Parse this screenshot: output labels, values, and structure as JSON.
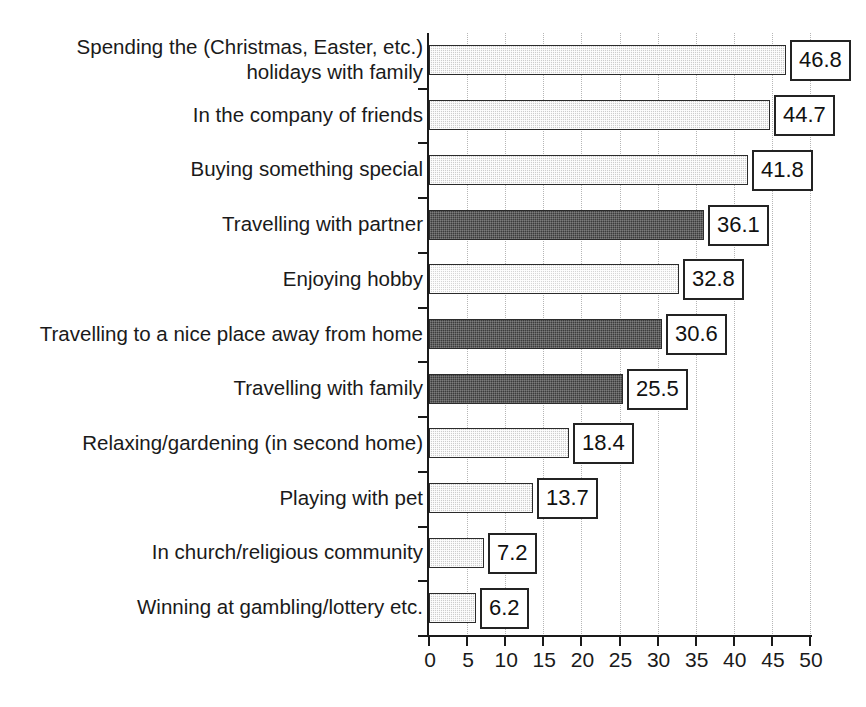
{
  "chart_data": {
    "type": "bar",
    "orientation": "horizontal",
    "title": "",
    "xlabel": "",
    "ylabel": "",
    "xlim": [
      0,
      50
    ],
    "xticks": [
      0,
      5,
      10,
      15,
      20,
      25,
      30,
      35,
      40,
      45,
      50
    ],
    "grid": "vertical-dotted",
    "legend": "none",
    "categories": [
      "Spending the (Christmas, Easter, etc.)\nholidays with family",
      "In the company of friends",
      "Buying something special",
      "Travelling with partner",
      "Enjoying hobby",
      "Travelling to a nice place away from home",
      "Travelling with family",
      "Relaxing/gardening (in second home)",
      "Playing with pet",
      "In church/religious community",
      "Winning at gambling/lottery etc."
    ],
    "values": [
      46.8,
      44.7,
      41.8,
      36.1,
      32.8,
      30.6,
      25.5,
      18.4,
      13.7,
      7.2,
      6.2
    ],
    "value_labels": [
      "46.8",
      "44.7",
      "41.8",
      "36.1",
      "32.8",
      "30.6",
      "25.5",
      "18.4",
      "13.7",
      "7.2",
      "6.2"
    ],
    "bar_styles": [
      "light",
      "light",
      "light",
      "dark",
      "lighter",
      "dark",
      "dark",
      "light",
      "light",
      "light",
      "light"
    ],
    "colors": {
      "light": "#cdcdcd",
      "lighter": "#d6d6d6",
      "dark": "#3c3c3c",
      "bar_border": "#2b2b2b",
      "axis": "#1a1a1a",
      "gridline": "#b6b6b6",
      "value_box_background": "#ffffff",
      "value_box_border": "#232323",
      "text": "#1a1a1a",
      "background": "#ffffff"
    }
  }
}
